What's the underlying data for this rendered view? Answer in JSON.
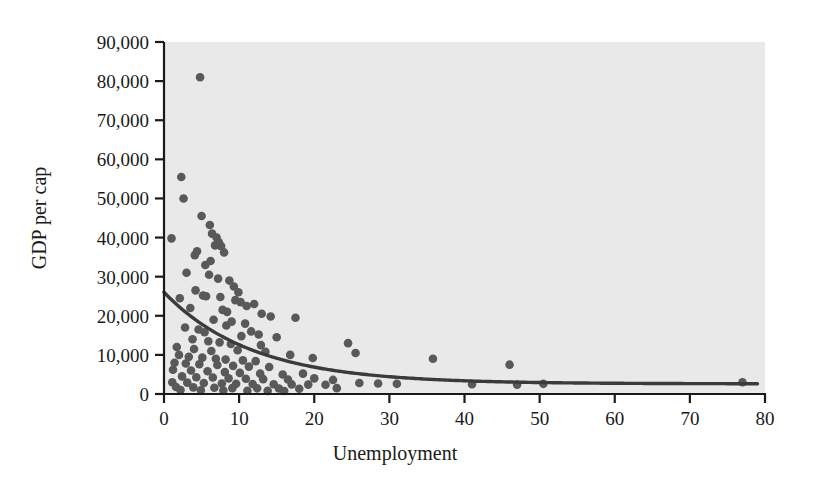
{
  "chart_data": {
    "type": "scatter",
    "title": "",
    "xlabel": "Unemployment",
    "ylabel": "GDP per cap",
    "xlim": [
      0,
      80
    ],
    "ylim": [
      0,
      90000
    ],
    "xticks": [
      0,
      10,
      20,
      30,
      40,
      50,
      60,
      70,
      80
    ],
    "xtick_labels": [
      "0",
      "10",
      "20",
      "30",
      "40",
      "50",
      "60",
      "70",
      "80"
    ],
    "yticks": [
      0,
      10000,
      20000,
      30000,
      40000,
      50000,
      60000,
      70000,
      80000,
      90000
    ],
    "ytick_labels": [
      "0",
      "10,000",
      "20,000",
      "30,000",
      "40,000",
      "50,000",
      "60,000",
      "70,000",
      "80,000",
      "90,000"
    ],
    "grid": false,
    "legend": null,
    "plot_background_color": "#e9e9e9",
    "point_color": "#595959",
    "curve_color": "#3b3b3b",
    "points": [
      [
        4.8,
        81000
      ],
      [
        2.3,
        55500
      ],
      [
        2.6,
        50000
      ],
      [
        1.0,
        39800
      ],
      [
        5.0,
        45500
      ],
      [
        6.1,
        43200
      ],
      [
        6.4,
        41000
      ],
      [
        7.0,
        40000
      ],
      [
        7.3,
        38800
      ],
      [
        6.8,
        38000
      ],
      [
        7.6,
        37800
      ],
      [
        4.4,
        36500
      ],
      [
        4.1,
        35500
      ],
      [
        8.0,
        36200
      ],
      [
        3.0,
        31000
      ],
      [
        6.0,
        30500
      ],
      [
        7.2,
        29500
      ],
      [
        8.7,
        29000
      ],
      [
        9.3,
        27500
      ],
      [
        4.2,
        26500
      ],
      [
        5.2,
        25200
      ],
      [
        5.6,
        25000
      ],
      [
        2.1,
        24500
      ],
      [
        9.5,
        24000
      ],
      [
        10.2,
        23500
      ],
      [
        11.0,
        22500
      ],
      [
        12.0,
        23000
      ],
      [
        3.5,
        22000
      ],
      [
        7.8,
        21500
      ],
      [
        8.4,
        21000
      ],
      [
        13.0,
        20500
      ],
      [
        14.2,
        19800
      ],
      [
        17.5,
        19500
      ],
      [
        6.6,
        19000
      ],
      [
        9.0,
        18500
      ],
      [
        10.8,
        18000
      ],
      [
        2.8,
        17000
      ],
      [
        4.6,
        16500
      ],
      [
        5.4,
        15800
      ],
      [
        11.6,
        16000
      ],
      [
        12.6,
        15200
      ],
      [
        15.0,
        14500
      ],
      [
        3.8,
        14000
      ],
      [
        5.9,
        13500
      ],
      [
        7.4,
        13200
      ],
      [
        8.9,
        12800
      ],
      [
        24.5,
        13000
      ],
      [
        1.7,
        12000
      ],
      [
        4.0,
        11500
      ],
      [
        6.3,
        11000
      ],
      [
        9.8,
        11200
      ],
      [
        13.5,
        10800
      ],
      [
        25.5,
        10500
      ],
      [
        2.0,
        10000
      ],
      [
        3.3,
        9500
      ],
      [
        5.1,
        9300
      ],
      [
        6.9,
        9000
      ],
      [
        8.2,
        8800
      ],
      [
        10.5,
        8600
      ],
      [
        12.2,
        8400
      ],
      [
        35.8,
        9000
      ],
      [
        1.4,
        8000
      ],
      [
        2.9,
        7800
      ],
      [
        4.7,
        7600
      ],
      [
        7.1,
        7400
      ],
      [
        9.2,
        7200
      ],
      [
        11.3,
        7000
      ],
      [
        14.0,
        6900
      ],
      [
        46.0,
        7500
      ],
      [
        1.2,
        6200
      ],
      [
        3.6,
        6000
      ],
      [
        5.8,
        5800
      ],
      [
        8.1,
        5600
      ],
      [
        10.1,
        5400
      ],
      [
        12.8,
        5200
      ],
      [
        15.8,
        5000
      ],
      [
        18.5,
        5200
      ],
      [
        2.4,
        4500
      ],
      [
        4.3,
        4300
      ],
      [
        6.5,
        4200
      ],
      [
        8.6,
        4000
      ],
      [
        10.9,
        3900
      ],
      [
        13.2,
        3800
      ],
      [
        16.5,
        3700
      ],
      [
        20.0,
        4000
      ],
      [
        22.5,
        3600
      ],
      [
        1.1,
        3000
      ],
      [
        3.1,
        2900
      ],
      [
        5.3,
        2800
      ],
      [
        7.7,
        2700
      ],
      [
        9.6,
        2600
      ],
      [
        11.8,
        2550
      ],
      [
        14.6,
        2500
      ],
      [
        17.0,
        2450
      ],
      [
        19.2,
        2400
      ],
      [
        21.5,
        2350
      ],
      [
        26.0,
        2800
      ],
      [
        28.5,
        2700
      ],
      [
        31.0,
        2600
      ],
      [
        1.6,
        1800
      ],
      [
        3.9,
        1700
      ],
      [
        6.7,
        1600
      ],
      [
        9.1,
        1500
      ],
      [
        12.4,
        1450
      ],
      [
        15.3,
        1400
      ],
      [
        18.0,
        1350
      ],
      [
        23.0,
        1500
      ],
      [
        41.0,
        2500
      ],
      [
        47.0,
        2400
      ],
      [
        50.5,
        2600
      ],
      [
        77.0,
        3000
      ],
      [
        2.2,
        1000
      ],
      [
        4.9,
        950
      ],
      [
        7.9,
        900
      ],
      [
        11.1,
        850
      ],
      [
        13.8,
        800
      ],
      [
        16.0,
        780
      ],
      [
        5.5,
        33000
      ],
      [
        6.2,
        34000
      ],
      [
        9.9,
        26000
      ],
      [
        16.8,
        10000
      ],
      [
        19.8,
        9200
      ],
      [
        8.3,
        17500
      ],
      [
        10.3,
        14800
      ],
      [
        12.9,
        12500
      ],
      [
        7.5,
        24800
      ]
    ],
    "fit_curve": {
      "description": "exponential decay fit",
      "y0": 26000,
      "asymptote": 2600,
      "decay_rate": 0.085,
      "x_start": 0,
      "x_end": 79
    }
  }
}
